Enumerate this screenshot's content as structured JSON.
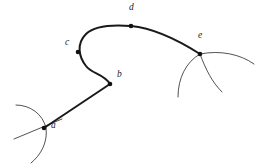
{
  "figure": {
    "background_color": "#ffffff",
    "curve_color": "#1a1a1a",
    "aux_color": "#333333",
    "width": 260,
    "height": 165
  },
  "chart_data": {
    "type": "line",
    "xlabel": "",
    "ylabel": "",
    "xlim": [
      0,
      260
    ],
    "ylim": [
      0,
      165
    ],
    "grid": false,
    "legend": "none",
    "points": [
      {
        "label": "a",
        "x": 44,
        "y": 128,
        "label_dx": 7,
        "label_dy": 2
      },
      {
        "label": "b",
        "x": 110,
        "y": 84,
        "label_dx": 7,
        "label_dy": -5
      },
      {
        "label": "c",
        "x": 78,
        "y": 52,
        "label_dx": -13,
        "label_dy": -5
      },
      {
        "label": "d",
        "x": 131,
        "y": 26,
        "label_dx": -2,
        "label_dy": -14
      },
      {
        "label": "e",
        "x": 200,
        "y": 54,
        "label_dx": -2,
        "label_dy": -14
      }
    ],
    "main_curve_path": "M 44,128 L 110,84 C 104,74 92,74 86,66 C 79,57 76,44 86,34 C 96,24 118,25 131,26 C 152,28 178,40 200,54",
    "aux_curves": [
      {
        "name": "arc-at-a-upper",
        "path": "M 16,105 C 30,105 43,114 46,128"
      },
      {
        "name": "arc-at-a-lower",
        "path": "M 46,128 C 48,142 41,155 31,163"
      },
      {
        "name": "line-through-a",
        "path": "M 14,139 L 62,119"
      },
      {
        "name": "arc-at-e-right",
        "path": "M 200,54 C 220,50 240,54 254,64"
      },
      {
        "name": "arc-at-e-lower-left",
        "path": "M 200,54 C 186,62 178,78 178,97"
      },
      {
        "name": "arc-at-e-lower-right",
        "path": "M 200,54 C 206,70 212,82 222,92"
      }
    ],
    "point_marker_radius": 2.3
  }
}
